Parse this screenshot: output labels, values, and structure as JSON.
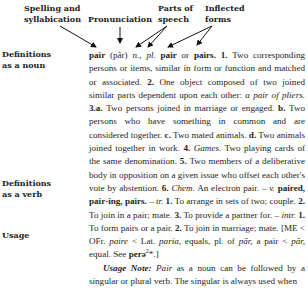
{
  "callouts": {
    "spelling": [
      "Spelling and",
      "syllabication"
    ],
    "pronunciation": "Pronunciation",
    "parts_of_speech": [
      "Parts of",
      "speech"
    ],
    "inflected_forms": [
      "Inflected",
      "forms"
    ]
  },
  "side_labels": {
    "noun": [
      "Definitions",
      "as a noun"
    ],
    "verb": [
      "Definitions",
      "as a verb"
    ],
    "usage": "Usage"
  },
  "entry": {
    "headword": "pair",
    "pronunciation": "(pâr)",
    "pos_noun": "n.,",
    "plural_label": "pl.",
    "plural_form_1": "pair",
    "or": "or",
    "plural_form_2": "pairs.",
    "noun_senses": [
      {
        "num": "1.",
        "text": "Two corresponding persons or items, similar in form or function and matched or associated."
      },
      {
        "num": "2.",
        "text": "One object composed of two joined similar parts dependent upon each other:",
        "example": "a pair of pliers."
      },
      {
        "num": "3.a.",
        "text": "Two persons joined in marriage or engaged."
      },
      {
        "num": "b.",
        "text": "Two persons who have something in common and are considered together."
      },
      {
        "num": "c.",
        "text": "Two mated animals."
      },
      {
        "num": "d.",
        "text": "Two animals joined together in work."
      },
      {
        "num": "4.",
        "label": "Games.",
        "text": "Two playing cards of the same denomination."
      },
      {
        "num": "5.",
        "text": "Two members of a deliberative body in opposition on a given issue who offset each other's vote by abstention."
      },
      {
        "num": "6.",
        "label": "Chem.",
        "text": "An electron pair."
      }
    ],
    "verb_dash": "–",
    "pos_verb": "v.",
    "verb_forms": "paired, pair·ing, pairs.",
    "transitive_label": "tr.",
    "transitive_senses": [
      {
        "num": "1.",
        "text": "To arrange in sets of two; couple."
      },
      {
        "num": "2.",
        "text": "To join in a pair; mate."
      },
      {
        "num": "3.",
        "text": "To provide a partner for."
      }
    ],
    "intransitive_label": "intr.",
    "intransitive_senses": [
      {
        "num": "1.",
        "text": "To form pairs or a pair."
      },
      {
        "num": "2.",
        "text": "To join in marriage; mate."
      }
    ],
    "etymology": {
      "open": "[ME < OFr.",
      "w1": "paire",
      "t1": "< Lat.",
      "w2": "paria,",
      "t2": "equals, pl. of",
      "w3": "pār,",
      "t3": "a pair <",
      "w4": "pār,",
      "t4": "equal. See",
      "root": "perə",
      "root_sup": "2",
      "close": "*.]"
    },
    "usage_note": {
      "label": "Usage Note:",
      "word": "Pair",
      "text": "as a noun can be followed by a singular or plural verb. The singular is always used when"
    }
  }
}
